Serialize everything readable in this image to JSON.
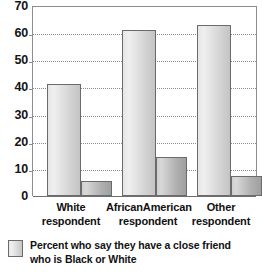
{
  "chart_data": {
    "type": "bar",
    "title": "",
    "xlabel": "",
    "ylabel": "",
    "ylim": [
      0,
      70
    ],
    "ytick_step": 10,
    "yticks": [
      70,
      60,
      50,
      40,
      30,
      20,
      10,
      0
    ],
    "ytick_labels": [
      "70",
      "60",
      "50",
      "40",
      "30",
      "20",
      "10",
      "0"
    ],
    "grid": true,
    "grid_style": "dotted-horizontal",
    "legend_position": "bottom-left",
    "categories": [
      "White respondent",
      "AfricanAmerican respondent",
      "Other respondent"
    ],
    "category_lines": [
      [
        "White",
        "respondent"
      ],
      [
        "AfricanAmerican",
        "respondent"
      ],
      [
        "Other",
        "respondent"
      ]
    ],
    "series": [
      {
        "name": "Percent who say they have a close friend who is Black or White",
        "values": [
          41.5,
          61.5,
          63.5
        ],
        "color": "#dcdcdc"
      },
      {
        "name": "Second bar",
        "values": [
          5.5,
          14.5,
          7.5
        ],
        "color": "#b8b8b8"
      }
    ],
    "legend": [
      {
        "label_line1": "Percent who say they have a close friend who",
        "label_line2": "is Black or White",
        "swatch_color": "#dcdcdc"
      }
    ],
    "colors": {
      "bar_light": "#dcdcdc",
      "bar_dark": "#b8b8b8",
      "bar_border": "#6b6b6b",
      "gridline": "#8a8a8a",
      "axis": "#8d8d8d",
      "text": "#111111",
      "background": "#ffffff"
    }
  }
}
